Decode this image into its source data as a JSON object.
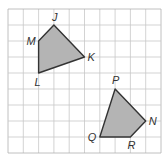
{
  "grid": {
    "cols": 10,
    "rows": 9,
    "origin_x": 8,
    "origin_y": 9,
    "cell_w": 15.3,
    "cell_h": 16,
    "line_color": "#c8c8c8",
    "border_color": "#b0b0b0"
  },
  "style": {
    "fill": "#b4b4b4",
    "stroke": "#333333"
  },
  "polygons": [
    {
      "name": "JKLM",
      "vertices": [
        {
          "label": "J",
          "col": 3,
          "row": 1,
          "dx": -2,
          "dy": -4
        },
        {
          "label": "K",
          "col": 5,
          "row": 3,
          "dx": 3,
          "dy": 4
        },
        {
          "label": "L",
          "col": 2,
          "row": 4,
          "dx": -4,
          "dy": 13
        },
        {
          "label": "M",
          "col": 2,
          "row": 2,
          "dx": -12,
          "dy": 4
        }
      ]
    },
    {
      "name": "PNRQ",
      "vertices": [
        {
          "label": "P",
          "col": 7,
          "row": 5,
          "dx": -3,
          "dy": -5
        },
        {
          "label": "N",
          "col": 9,
          "row": 7,
          "dx": 3,
          "dy": 4
        },
        {
          "label": "R",
          "col": 8,
          "row": 8,
          "dx": -3,
          "dy": 12
        },
        {
          "label": "Q",
          "col": 6,
          "row": 8,
          "dx": -12,
          "dy": 4
        }
      ]
    }
  ]
}
